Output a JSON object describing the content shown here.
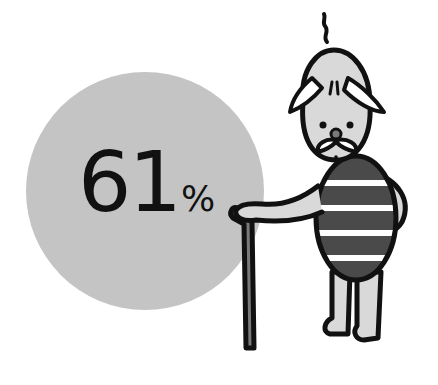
{
  "stat": {
    "value": "61",
    "unit": "%"
  },
  "illustration": {
    "subject": "old-man-with-cane-icon",
    "colors": {
      "circle": "#c4c4c4",
      "skin": "#d9d9d9",
      "outline": "#111111",
      "shirt_dark": "#4a4a4a",
      "shirt_stripe": "#ffffff",
      "cane": "#7a7a7a"
    }
  }
}
